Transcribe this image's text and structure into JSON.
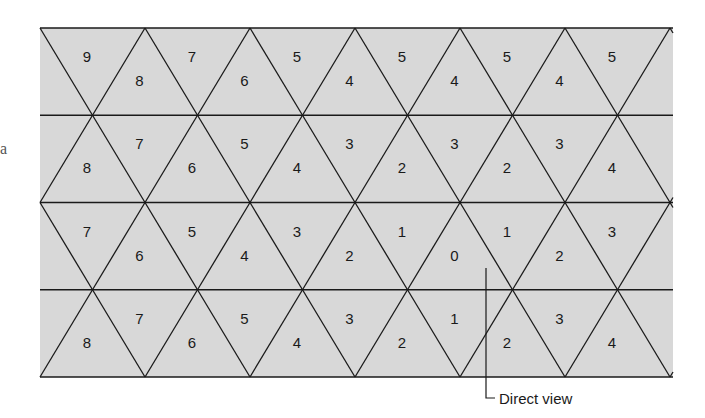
{
  "diagram": {
    "type": "triangular-grid",
    "fill_color": "#d8d8d8",
    "line_color": "#1a1a1a",
    "rows": [
      {
        "index": 0,
        "labels": [
          "9",
          "8",
          "7",
          "6",
          "5",
          "4",
          "5",
          "4",
          "5",
          "4",
          "5"
        ]
      },
      {
        "index": 1,
        "labels": [
          "8",
          "7",
          "6",
          "5",
          "4",
          "3",
          "2",
          "3",
          "2",
          "3",
          "4"
        ]
      },
      {
        "index": 2,
        "labels": [
          "7",
          "6",
          "5",
          "4",
          "3",
          "2",
          "1",
          "0",
          "1",
          "2",
          "3"
        ]
      },
      {
        "index": 3,
        "labels": [
          "8",
          "7",
          "6",
          "5",
          "4",
          "3",
          "2",
          "1",
          "2",
          "3",
          "4"
        ]
      }
    ],
    "callout": {
      "label": "Direct view",
      "target_value": "0"
    },
    "left_margin_fragment": "a"
  }
}
